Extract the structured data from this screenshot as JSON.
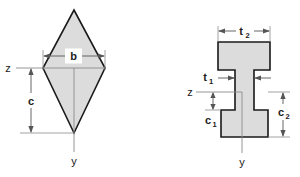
{
  "figure": {
    "background_color": "#ffffff",
    "shape_fill_color": "#dcdcdc",
    "shape_stroke_color": "#1a1a1a",
    "dimension_color": "#555555",
    "diagrams": [
      {
        "name": "kite-cross-section",
        "shape": "kite",
        "labels": {
          "width": "b",
          "neutral_axis": "z",
          "depth": "c",
          "vertical_axis": "y"
        }
      },
      {
        "name": "i-beam-cross-section",
        "shape": "i-beam",
        "labels": {
          "flange_width": "t",
          "flange_width_sub": "2",
          "web_thickness": "t",
          "web_thickness_sub": "1",
          "neutral_axis": "z",
          "lower_depth": "c",
          "lower_depth_sub": "1",
          "upper_depth": "c",
          "upper_depth_sub": "2",
          "vertical_axis": "y"
        }
      }
    ]
  }
}
